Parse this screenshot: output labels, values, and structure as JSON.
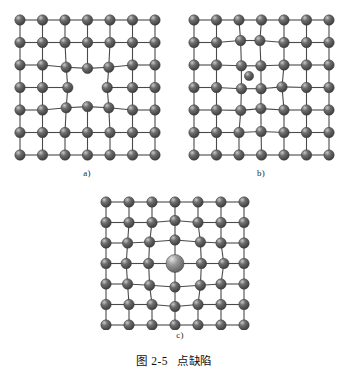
{
  "figure": {
    "caption_number": "图 2-5",
    "caption_title": "点缺陷",
    "background_color": "#ffffff"
  },
  "style": {
    "atom_fill_dark": "#6e6e6e",
    "atom_fill_dark_edge": "#3a3a3a",
    "atom_highlight": "#c8c8c8",
    "atom_fill_light": "#9a9a9a",
    "atom_fill_light_edge": "#5a5a5a",
    "bond_color": "#4a4a4a",
    "atom_radius": 5.2,
    "interstitial_radius": 4.6,
    "substitutional_radius": 9.0,
    "bond_width": 1.1
  },
  "panels": [
    {
      "id": "a",
      "label": "a)",
      "defect_type": "vacancy",
      "defect_description": "空位",
      "rows": 7,
      "cols": 7,
      "origin": {
        "x": 14,
        "y": 14
      },
      "spacing": {
        "x": 22.5,
        "y": 22.5
      },
      "vacancy_cell": {
        "row": 3,
        "col": 3
      },
      "displacements": [
        {
          "row": 2,
          "col": 2,
          "dx": 1.2,
          "dy": 2.2
        },
        {
          "row": 2,
          "col": 3,
          "dx": 0.0,
          "dy": 3.4
        },
        {
          "row": 2,
          "col": 4,
          "dx": -1.2,
          "dy": 2.2
        },
        {
          "row": 3,
          "col": 2,
          "dx": 2.8,
          "dy": 0.0
        },
        {
          "row": 3,
          "col": 4,
          "dx": -2.8,
          "dy": 0.0
        },
        {
          "row": 4,
          "col": 2,
          "dx": 1.2,
          "dy": -2.2
        },
        {
          "row": 4,
          "col": 3,
          "dx": 0.0,
          "dy": -3.4
        },
        {
          "row": 4,
          "col": 4,
          "dx": -1.2,
          "dy": -2.2
        }
      ]
    },
    {
      "id": "b",
      "label": "b)",
      "defect_type": "interstitial",
      "defect_description": "间隙原子",
      "rows": 7,
      "cols": 7,
      "origin": {
        "x": 14,
        "y": 14
      },
      "spacing": {
        "x": 22.5,
        "y": 22.5
      },
      "interstitial": {
        "x": 69.0,
        "y": 70.0
      },
      "displacements": [
        {
          "row": 1,
          "col": 2,
          "dx": 1.6,
          "dy": -2.0
        },
        {
          "row": 1,
          "col": 3,
          "dx": -1.6,
          "dy": -2.0
        },
        {
          "row": 2,
          "col": 2,
          "dx": 2.4,
          "dy": 0.8
        },
        {
          "row": 2,
          "col": 3,
          "dx": -0.6,
          "dy": 0.8
        },
        {
          "row": 3,
          "col": 2,
          "dx": 2.4,
          "dy": 1.2
        },
        {
          "row": 3,
          "col": 3,
          "dx": -0.4,
          "dy": 1.2
        },
        {
          "row": 3,
          "col": 4,
          "dx": -2.0,
          "dy": -0.6
        },
        {
          "row": 4,
          "col": 2,
          "dx": 1.8,
          "dy": 0.4
        },
        {
          "row": 4,
          "col": 3,
          "dx": -0.6,
          "dy": -1.4
        },
        {
          "row": 5,
          "col": 3,
          "dx": -0.4,
          "dy": -1.0
        }
      ]
    },
    {
      "id": "c",
      "label": "c)",
      "defect_type": "substitutional",
      "defect_description": "置换原子（大半径）",
      "rows": 8,
      "cols": 7,
      "origin": {
        "x": 14,
        "y": 12
      },
      "spacing": {
        "x": 23.0,
        "y": 20.5
      },
      "substitutional_cell": {
        "row": 3,
        "col": 3
      },
      "displacements": [
        {
          "row": 1,
          "col": 3,
          "dx": 0.0,
          "dy": -2.0
        },
        {
          "row": 2,
          "col": 2,
          "dx": -2.4,
          "dy": -1.0
        },
        {
          "row": 2,
          "col": 3,
          "dx": 0.0,
          "dy": -3.0
        },
        {
          "row": 2,
          "col": 4,
          "dx": 2.4,
          "dy": -1.0
        },
        {
          "row": 3,
          "col": 1,
          "dx": -2.8,
          "dy": 0.0
        },
        {
          "row": 3,
          "col": 2,
          "dx": -3.4,
          "dy": 0.0
        },
        {
          "row": 3,
          "col": 4,
          "dx": 3.4,
          "dy": 0.0
        },
        {
          "row": 3,
          "col": 5,
          "dx": 2.8,
          "dy": 0.0
        },
        {
          "row": 4,
          "col": 2,
          "dx": -2.4,
          "dy": 1.2
        },
        {
          "row": 4,
          "col": 3,
          "dx": 0.0,
          "dy": 3.0
        },
        {
          "row": 4,
          "col": 4,
          "dx": 2.4,
          "dy": 1.2
        },
        {
          "row": 5,
          "col": 3,
          "dx": 0.0,
          "dy": 2.0
        },
        {
          "row": 2,
          "col": 1,
          "dx": -1.4,
          "dy": 0.0
        },
        {
          "row": 4,
          "col": 1,
          "dx": -1.4,
          "dy": 0.0
        }
      ]
    }
  ]
}
